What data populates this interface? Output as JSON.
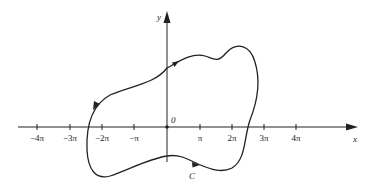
{
  "diagram": {
    "axes": {
      "x_label": "x",
      "y_label": "y",
      "origin_label": "0",
      "x_ticks": [
        "−4π",
        "−3π",
        "−2π",
        "−π",
        "π",
        "2π",
        "3π",
        "4π"
      ]
    },
    "curve": {
      "label": "C",
      "orientation": "counterclockwise",
      "description": "Closed irregular curve enclosing the origin with direction arrows"
    },
    "colors": {
      "stroke": "#222222",
      "background": "#ffffff"
    }
  }
}
